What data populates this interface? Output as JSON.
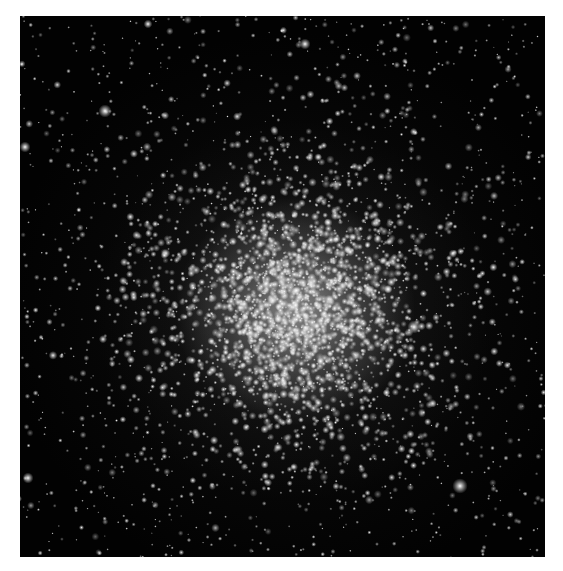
{
  "image": {
    "subject": "Globular star cluster",
    "description": "Grayscale astronomical photograph of a dense globular star cluster centered slightly below and right of the middle, surrounded by scattered field stars on a black sky, framed by a white border",
    "colors": {
      "border": "#ffffff",
      "sky": "#020202",
      "core_glow": "#c8c8c8",
      "star": "#ffffff"
    },
    "cluster_center": {
      "x": 275,
      "y": 295
    },
    "bright_stars": [
      {
        "x": 85,
        "y": 95,
        "r": 3
      },
      {
        "x": 394,
        "y": 311,
        "r": 3
      },
      {
        "x": 440,
        "y": 470,
        "r": 3.5
      },
      {
        "x": 5,
        "y": 131,
        "r": 2.5
      },
      {
        "x": 128,
        "y": 8,
        "r": 2
      },
      {
        "x": 285,
        "y": 28,
        "r": 2.5
      },
      {
        "x": 8,
        "y": 462,
        "r": 2.5
      }
    ]
  }
}
